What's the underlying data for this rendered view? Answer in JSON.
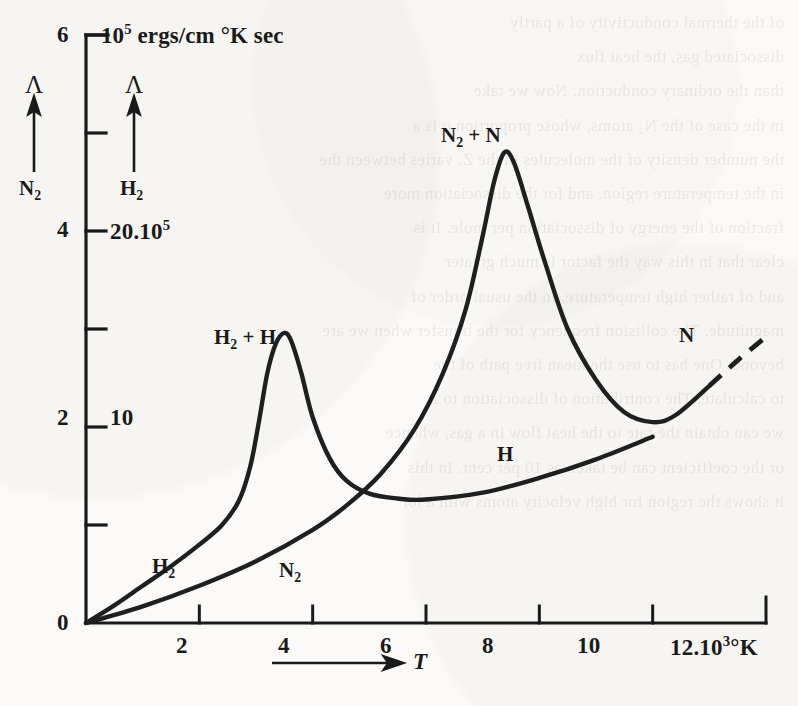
{
  "page": {
    "background_color": "#fbfaf8",
    "ink_color": "#1a1a1a",
    "width": 798,
    "height": 706
  },
  "axes": {
    "y_unit_label": "10⁵ ergs/cm °K sec",
    "y_left_series": "N₂",
    "y_right_series": "H₂",
    "y_symbol": "Λ",
    "y_left_ticks": [
      "0",
      "2",
      "4",
      "6"
    ],
    "y_right_ticks": [
      "10",
      "20.10⁵"
    ],
    "x_ticks": [
      "2",
      "4",
      "6",
      "8",
      "10"
    ],
    "x_end_label": "12.10³°K",
    "x_symbol": "T"
  },
  "curve_labels": {
    "h2_low": "H₂",
    "n2_low": "N₂",
    "h2_peak": "H₂ + H",
    "n2_peak": "N₂ + N",
    "h_branch": "H",
    "n_branch": "N"
  },
  "ghost_text_lines": [
    "of the thermal conductivity of a partly",
    "",
    "dissociated gas, the heat flux",
    "",
    "than the ordinary conduction. Now we take",
    "in the case of the N₂ atoms, whose proportion α is a",
    "the number density of the molecules in the Z. varies between the",
    "in the temperature region, and for the dissociation more",
    "fraction of the energy of dissociation per mole. It is",
    "clear that in this way the factor is much greater",
    "and of rather high temperature, in the usual order of",
    "magnitude. The collision frequency for the transfer when we are",
    "beyond. One has to use the mean free path of the",
    "to calculate. The contribution of dissociation to Λ",
    "we can obtain the rate to the heat flow in a gas, whence",
    "or the coefficient can be taken as 10 per cent. In this",
    "it shows the region for high velocity atoms with a lot"
  ],
  "chart_data": {
    "type": "line",
    "title": "",
    "subtitle": "",
    "xlabel": "T",
    "ylabel": "Λ",
    "xlim": [
      0,
      12
    ],
    "ylim": [
      0,
      6
    ],
    "y2lim": [
      0,
      30
    ],
    "grid": false,
    "legend": "inline-curve-labels",
    "x_unit": "10³ °K",
    "y_unit": "10⁵ ergs/cm °K sec",
    "y_left_tick_values": [
      0,
      2,
      4,
      6
    ],
    "y_left_minor_tick_values": [
      1,
      3,
      5
    ],
    "y_right_tick_values": [
      10,
      20
    ],
    "x_tick_values": [
      2,
      4,
      6,
      8,
      10,
      12
    ],
    "series": [
      {
        "name": "H₂ + H",
        "label_on_chart": "H₂ + H",
        "scale": "right",
        "note": "H2 conductivity: smooth rise then sharp dissociation peak near T=3.5, falling to flat plateau, then slow rise labelled H",
        "points": [
          [
            0.0,
            0.0
          ],
          [
            0.5,
            0.18
          ],
          [
            1.0,
            0.38
          ],
          [
            1.5,
            0.58
          ],
          [
            2.0,
            0.8
          ],
          [
            2.4,
            1.0
          ],
          [
            2.7,
            1.25
          ],
          [
            2.9,
            1.6
          ],
          [
            3.05,
            2.05
          ],
          [
            3.2,
            2.55
          ],
          [
            3.35,
            2.85
          ],
          [
            3.5,
            2.96
          ],
          [
            3.62,
            2.88
          ],
          [
            3.8,
            2.55
          ],
          [
            4.0,
            2.1
          ],
          [
            4.3,
            1.68
          ],
          [
            4.6,
            1.45
          ],
          [
            5.0,
            1.32
          ],
          [
            5.5,
            1.27
          ],
          [
            6.0,
            1.26
          ],
          [
            7.0,
            1.33
          ],
          [
            8.0,
            1.48
          ],
          [
            9.0,
            1.67
          ],
          [
            10.0,
            1.9
          ]
        ]
      },
      {
        "name": "N₂ + N",
        "label_on_chart": "N₂ + N",
        "scale": "left",
        "note": "N2 conductivity: slow rise, sharp dissociation peak near T=7.4 reaching ~4.8, decay to minimum ~2.05 near T=10, then rising branch labelled N, dashed beyond T=11",
        "points": [
          [
            0.0,
            0.0
          ],
          [
            1.0,
            0.17
          ],
          [
            2.0,
            0.38
          ],
          [
            3.0,
            0.63
          ],
          [
            4.0,
            0.95
          ],
          [
            4.6,
            1.2
          ],
          [
            5.2,
            1.52
          ],
          [
            5.8,
            1.98
          ],
          [
            6.3,
            2.55
          ],
          [
            6.7,
            3.2
          ],
          [
            7.0,
            3.95
          ],
          [
            7.2,
            4.5
          ],
          [
            7.38,
            4.8
          ],
          [
            7.55,
            4.7
          ],
          [
            7.8,
            4.25
          ],
          [
            8.1,
            3.68
          ],
          [
            8.5,
            3.0
          ],
          [
            9.0,
            2.48
          ],
          [
            9.5,
            2.15
          ],
          [
            10.0,
            2.05
          ],
          [
            10.4,
            2.12
          ],
          [
            11.0,
            2.42
          ],
          [
            11.5,
            2.68
          ],
          [
            12.0,
            2.92
          ]
        ],
        "dashed_from_x": 11.0
      }
    ],
    "annotations": [
      {
        "text": "H₂",
        "x": 1.7,
        "y": 0.55,
        "scale": "right"
      },
      {
        "text": "N₂",
        "x": 3.3,
        "y": 0.5,
        "scale": "left"
      },
      {
        "text": "H₂ + H",
        "x": 3.3,
        "y": 3.35,
        "scale": "right"
      },
      {
        "text": "N₂ + N",
        "x": 7.3,
        "y": 5.25,
        "scale": "left"
      },
      {
        "text": "H",
        "x": 8.3,
        "y": 1.72,
        "scale": "right"
      },
      {
        "text": "N",
        "x": 11.2,
        "y": 2.72,
        "scale": "left"
      }
    ]
  }
}
